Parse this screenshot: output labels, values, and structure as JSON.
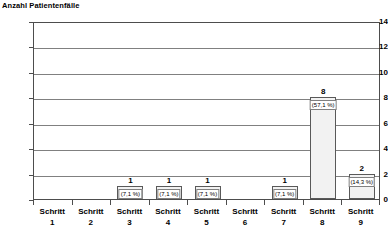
{
  "chart_data": {
    "type": "bar",
    "title": "Anzahl Patientenfälle",
    "xlabel": "",
    "ylabel": "Anzahl Patientenfälle",
    "ylim": [
      0,
      14
    ],
    "yticks": [
      0,
      2,
      4,
      6,
      8,
      10,
      12,
      14
    ],
    "ytick_labels": [
      "0",
      "2",
      "4",
      "6",
      "8",
      "10",
      "12",
      "14"
    ],
    "grid": true,
    "legend": "none",
    "categories": [
      "Schritt 1",
      "Schritt 2",
      "Schritt 3",
      "Schritt 4",
      "Schritt 5",
      "Schritt 6",
      "Schritt 7",
      "Schritt 8",
      "Schritt 9"
    ],
    "category_lines": [
      {
        "line1": "Schritt",
        "line2": "1"
      },
      {
        "line1": "Schritt",
        "line2": "2"
      },
      {
        "line1": "Schritt",
        "line2": "3"
      },
      {
        "line1": "Schritt",
        "line2": "4"
      },
      {
        "line1": "Schritt",
        "line2": "5"
      },
      {
        "line1": "Schritt",
        "line2": "6"
      },
      {
        "line1": "Schritt",
        "line2": "7"
      },
      {
        "line1": "Schritt",
        "line2": "8"
      },
      {
        "line1": "Schritt",
        "line2": "9"
      }
    ],
    "values": [
      0,
      0,
      1,
      1,
      1,
      0,
      1,
      8,
      2
    ],
    "value_labels": [
      "",
      "",
      "1",
      "1",
      "1",
      "",
      "1",
      "8",
      "2"
    ],
    "percent_labels": [
      "",
      "",
      "(7,1 %)",
      "(7,1 %)",
      "(7,1 %)",
      "",
      "(7,1 %)",
      "(57,1 %)",
      "(14,3 %)"
    ],
    "colors": {
      "bar_fill": "#f2f2f2",
      "bar_border": "#595959",
      "gridline": "#808080",
      "axis": "#4d4d4d",
      "text": "#000000",
      "background": "#ffffff"
    }
  }
}
